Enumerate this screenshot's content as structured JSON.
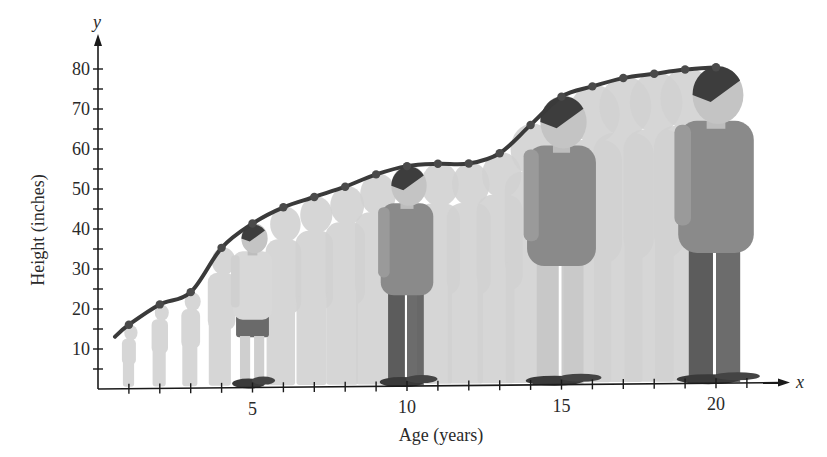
{
  "chart_data": {
    "type": "line",
    "title": "",
    "xlabel": "Age (years)",
    "ylabel": "Height (inches)",
    "x_axis_letter": "x",
    "y_axis_letter": "y",
    "x": [
      1,
      2,
      3,
      4,
      5,
      6,
      7,
      8,
      9,
      10,
      11,
      12,
      13,
      14,
      15,
      16,
      17,
      18,
      19,
      20
    ],
    "series": [
      {
        "name": "Height",
        "values": [
          16,
          21,
          24,
          35,
          41,
          45,
          47.5,
          50,
          53,
          55,
          55.5,
          55.5,
          58,
          65,
          72,
          74.5,
          76.5,
          77.5,
          78.5,
          79
        ]
      }
    ],
    "x_ticks": [
      1,
      2,
      3,
      4,
      5,
      6,
      7,
      8,
      9,
      10,
      11,
      12,
      13,
      14,
      15,
      16,
      17,
      18,
      19,
      20,
      21
    ],
    "x_tick_labels": [
      "5",
      "10",
      "15",
      "20"
    ],
    "x_tick_label_values": [
      5,
      10,
      15,
      20
    ],
    "y_ticks": [
      5,
      10,
      15,
      20,
      25,
      30,
      35,
      40,
      45,
      50,
      55,
      60,
      65,
      70,
      75,
      80
    ],
    "y_tick_labels": [
      "10",
      "20",
      "30",
      "40",
      "50",
      "60",
      "70",
      "80"
    ],
    "y_tick_label_values": [
      10,
      20,
      30,
      40,
      50,
      60,
      70,
      80
    ],
    "xlim": [
      0,
      22
    ],
    "ylim": [
      0,
      85
    ],
    "grid": false,
    "legend": "none",
    "annotations": "Silhouettes of a person growing from age 1 to 20 drawn beneath each data point; highlighted figures at ages 5, 10, 15 and 20",
    "highlighted_ages": [
      5,
      10,
      15,
      20
    ],
    "colors": {
      "curve": "#3a3a3a",
      "marker": "#4a4a4a",
      "silhouette": "#d2d2d2",
      "axis": "#1a1a1a"
    }
  }
}
